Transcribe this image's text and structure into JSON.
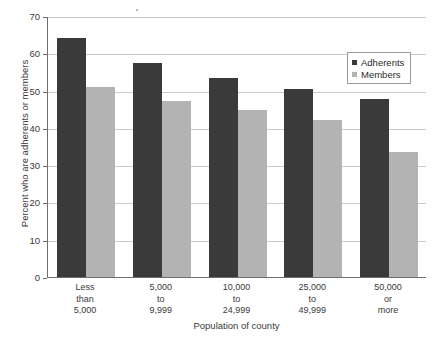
{
  "chart_data": {
    "type": "bar",
    "title": "",
    "xlabel": "Population of county",
    "ylabel": "Percent who are adherents or members",
    "categories": [
      "Less than 5,000",
      "5,000 to 9,999",
      "10,000 to 24,999",
      "25,000 to 49,999",
      "50,000 or more"
    ],
    "category_lines": [
      [
        "Less",
        "than",
        "5,000"
      ],
      [
        "5,000",
        "to",
        "9,999"
      ],
      [
        "10,000",
        "to",
        "24,999"
      ],
      [
        "25,000",
        "to",
        "49,999"
      ],
      [
        "50,000",
        "or",
        "more"
      ]
    ],
    "series": [
      {
        "name": "Adherents",
        "color": "#3a3a3a",
        "values": [
          64,
          57.5,
          53.5,
          50.3,
          47.8
        ]
      },
      {
        "name": "Members",
        "color": "#b3b3b3",
        "values": [
          51,
          47.3,
          44.8,
          42.2,
          33.5
        ]
      }
    ],
    "ylim": [
      0,
      70
    ],
    "yticks": [
      0,
      10,
      20,
      30,
      40,
      50,
      60,
      70
    ],
    "ytick_labels": [
      "0",
      "10",
      "20",
      "30",
      "40",
      "50",
      "60",
      "70"
    ],
    "grid": true,
    "grid_axis": "y",
    "legend_position": "top-right",
    "legend_entries": [
      "Adherents",
      "Members"
    ]
  },
  "colors": {
    "adherents": "#3a3a3a",
    "members": "#b3b3b3",
    "axis": "#6e6e6e",
    "grid": "#c9c9c9",
    "text": "#3a3a3a",
    "background": "#ffffff"
  }
}
